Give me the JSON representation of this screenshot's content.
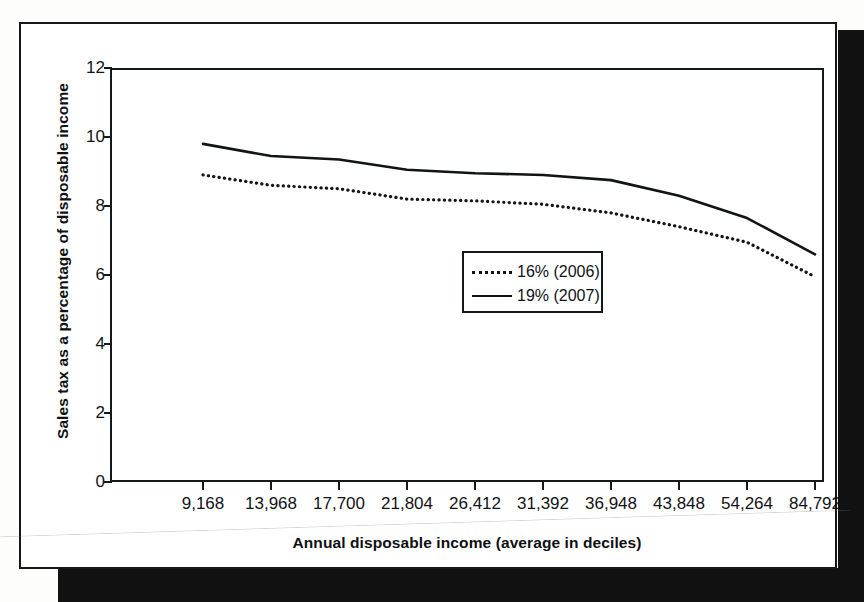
{
  "chart_data": {
    "type": "line",
    "title": "",
    "subtitle": "",
    "xlabel": "Annual disposable income (average in deciles)",
    "ylabel": "Sales tax as a percentage of disposable income",
    "categories": [
      "9,168",
      "13,968",
      "17,700",
      "21,804",
      "26,412",
      "31,392",
      "36,948",
      "43,848",
      "54,264",
      "84,792"
    ],
    "x_tick_labels": [
      "9,168",
      "13,968",
      "17,700",
      "21,804",
      "26,412",
      "31,392",
      "36,948",
      "43,848",
      "54,264",
      "84,792"
    ],
    "y_tick_labels": [
      "12",
      "10",
      "8",
      "6",
      "4",
      "2",
      "0"
    ],
    "y_ticks": [
      12,
      10,
      8,
      6,
      4,
      2,
      0
    ],
    "ylim": [
      0,
      12
    ],
    "grid": false,
    "legend_position": "center",
    "series": [
      {
        "name": "16% (2006)",
        "style": "dotted",
        "color": "#111315",
        "values": [
          8.9,
          8.6,
          8.5,
          8.2,
          8.15,
          8.05,
          7.8,
          7.4,
          6.95,
          5.95
        ]
      },
      {
        "name": "19% (2007)",
        "style": "solid",
        "color": "#111315",
        "values": [
          9.8,
          9.45,
          9.35,
          9.05,
          8.95,
          8.9,
          8.75,
          8.3,
          7.65,
          6.6
        ]
      }
    ]
  },
  "legend": {
    "entries": [
      {
        "label": "16% (2006)",
        "style": "dotted"
      },
      {
        "label": "19% (2007)",
        "style": "solid"
      }
    ]
  },
  "colors": {
    "ink": "#111315",
    "frame": "#15181a",
    "paper": "#ffffff",
    "shadow": "#111111"
  }
}
